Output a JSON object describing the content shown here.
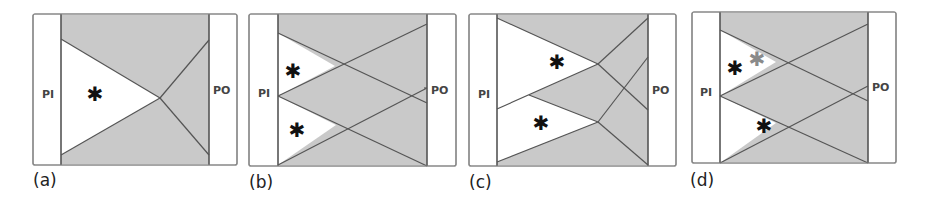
{
  "colors": {
    "shaded": "#c9c9c9",
    "line": "#555555",
    "frame": "#888888",
    "white": "#ffffff",
    "star_black": "#111111",
    "star_gray": "#8a8a8a"
  },
  "strip_labels": {
    "left": "PI",
    "right": "PO"
  },
  "star_glyph": "✱",
  "panels": [
    {
      "label": "(a)",
      "box": [
        33,
        14,
        237,
        165
      ],
      "left_div": 61,
      "right_div": 209,
      "white_regions": [
        [
          [
            61,
            39
          ],
          [
            160,
            98
          ],
          [
            61,
            155
          ]
        ]
      ],
      "lines": [
        [
          [
            61,
            39
          ],
          [
            160,
            98
          ]
        ],
        [
          [
            61,
            155
          ],
          [
            160,
            98
          ]
        ],
        [
          [
            160,
            98
          ],
          [
            209,
            40
          ]
        ],
        [
          [
            160,
            98
          ],
          [
            209,
            155
          ]
        ]
      ],
      "stars": [
        {
          "x": 95,
          "y": 94,
          "color": "black"
        }
      ],
      "label_pos": [
        33,
        170
      ],
      "pi_pos": [
        42,
        88
      ],
      "po_pos": [
        213,
        84
      ]
    },
    {
      "label": "(b)",
      "box": [
        249,
        14,
        456,
        166
      ],
      "left_div": 278,
      "right_div": 427,
      "white_regions": [
        [
          [
            278,
            33
          ],
          [
            335,
            66
          ],
          [
            278,
            96
          ]
        ],
        [
          [
            278,
            96
          ],
          [
            336,
            125
          ],
          [
            278,
            165
          ]
        ]
      ],
      "lines": [
        [
          [
            278,
            33
          ],
          [
            427,
            103
          ]
        ],
        [
          [
            278,
            96
          ],
          [
            427,
            24
          ]
        ],
        [
          [
            278,
            96
          ],
          [
            427,
            166
          ]
        ],
        [
          [
            278,
            165
          ],
          [
            427,
            88
          ]
        ],
        [
          [
            424,
            88
          ],
          [
            427,
            88
          ]
        ]
      ],
      "stars": [
        {
          "x": 293,
          "y": 71,
          "color": "black"
        },
        {
          "x": 297,
          "y": 130,
          "color": "black"
        }
      ],
      "label_pos": [
        249,
        172
      ],
      "pi_pos": [
        258,
        87
      ],
      "po_pos": [
        431,
        84
      ]
    },
    {
      "label": "(c)",
      "box": [
        469,
        14,
        676,
        166
      ],
      "left_div": 497,
      "right_div": 648,
      "white_regions": [
        [
          [
            497,
            18
          ],
          [
            598,
            64
          ],
          [
            497,
            109
          ]
        ],
        [
          [
            497,
            109
          ],
          [
            529,
            95
          ],
          [
            598,
            122
          ],
          [
            497,
            162
          ]
        ]
      ],
      "lines": [
        [
          [
            497,
            18
          ],
          [
            598,
            64
          ]
        ],
        [
          [
            598,
            64
          ],
          [
            497,
            109
          ]
        ],
        [
          [
            529,
            95
          ],
          [
            598,
            122
          ]
        ],
        [
          [
            497,
            162
          ],
          [
            598,
            122
          ]
        ],
        [
          [
            598,
            64
          ],
          [
            648,
            18
          ]
        ],
        [
          [
            598,
            64
          ],
          [
            648,
            110
          ]
        ],
        [
          [
            598,
            122
          ],
          [
            648,
            57
          ]
        ],
        [
          [
            598,
            122
          ],
          [
            648,
            165
          ]
        ]
      ],
      "stars": [
        {
          "x": 557,
          "y": 62,
          "color": "black"
        },
        {
          "x": 541,
          "y": 123,
          "color": "black"
        }
      ],
      "label_pos": [
        469,
        172
      ],
      "pi_pos": [
        478,
        88
      ],
      "po_pos": [
        652,
        84
      ]
    },
    {
      "label": "(d)",
      "box": [
        692,
        12,
        896,
        163
      ],
      "left_div": 720,
      "right_div": 868,
      "white_regions": [
        [
          [
            720,
            30
          ],
          [
            776,
            62
          ],
          [
            720,
            96
          ]
        ],
        [
          [
            720,
            96
          ],
          [
            776,
            123
          ],
          [
            720,
            163
          ]
        ]
      ],
      "lines": [
        [
          [
            720,
            30
          ],
          [
            868,
            101
          ]
        ],
        [
          [
            720,
            96
          ],
          [
            868,
            24
          ]
        ],
        [
          [
            720,
            96
          ],
          [
            868,
            163
          ]
        ],
        [
          [
            720,
            163
          ],
          [
            868,
            86
          ]
        ]
      ],
      "stars": [
        {
          "x": 735,
          "y": 68,
          "color": "black"
        },
        {
          "x": 757,
          "y": 59,
          "color": "gray"
        },
        {
          "x": 764,
          "y": 126,
          "color": "black"
        }
      ],
      "label_pos": [
        690,
        170
      ],
      "pi_pos": [
        700,
        86
      ],
      "po_pos": [
        872,
        81
      ]
    }
  ]
}
